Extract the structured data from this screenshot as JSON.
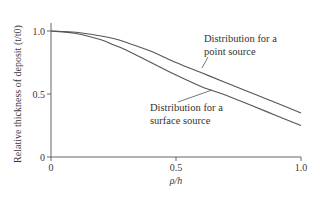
{
  "chart_data": {
    "type": "line",
    "title": "",
    "xlabel": "ρ/h",
    "ylabel": "Relative thickness of deposit (t/t0)",
    "ylabel_parts": {
      "main": "Relative thickness of deposit (",
      "var": "t",
      "slash": "/",
      "var2": "t",
      "sub": "0",
      "close": ")"
    },
    "xlim": [
      0,
      1.0
    ],
    "ylim": [
      0,
      1.0
    ],
    "xticks": [
      0,
      0.5,
      1.0
    ],
    "xtick_labels": [
      "0",
      "0.5",
      "1.0"
    ],
    "yticks": [
      0,
      0.5,
      1.0
    ],
    "ytick_labels": [
      "0",
      "0.5",
      "1.0"
    ],
    "grid": false,
    "legend": "none (inline annotations)",
    "x": [
      0,
      0.1,
      0.2,
      0.25,
      0.3,
      0.4,
      0.5,
      0.6,
      0.7,
      0.75,
      0.8,
      0.9,
      1.0
    ],
    "series": [
      {
        "name": "Distribution for a point source",
        "values": [
          1.0,
          0.99,
          0.96,
          0.94,
          0.91,
          0.84,
          0.75,
          0.67,
          0.59,
          0.55,
          0.51,
          0.43,
          0.35
        ],
        "color": "#555555"
      },
      {
        "name": "Distribution for a surface source",
        "values": [
          1.0,
          0.98,
          0.93,
          0.89,
          0.85,
          0.75,
          0.65,
          0.56,
          0.49,
          0.45,
          0.41,
          0.33,
          0.25
        ],
        "color": "#555555"
      }
    ],
    "annotations": [
      {
        "lines": [
          "Distribution for a",
          "point source"
        ],
        "target_series": 0
      },
      {
        "lines": [
          "Distribution for a",
          "surface source"
        ],
        "target_series": 1
      }
    ]
  },
  "layout": {
    "plot": {
      "x0": 51,
      "x1": 301,
      "y0": 157,
      "y1": 31
    },
    "axis_color": "#666666",
    "curve_color": "#555555"
  }
}
